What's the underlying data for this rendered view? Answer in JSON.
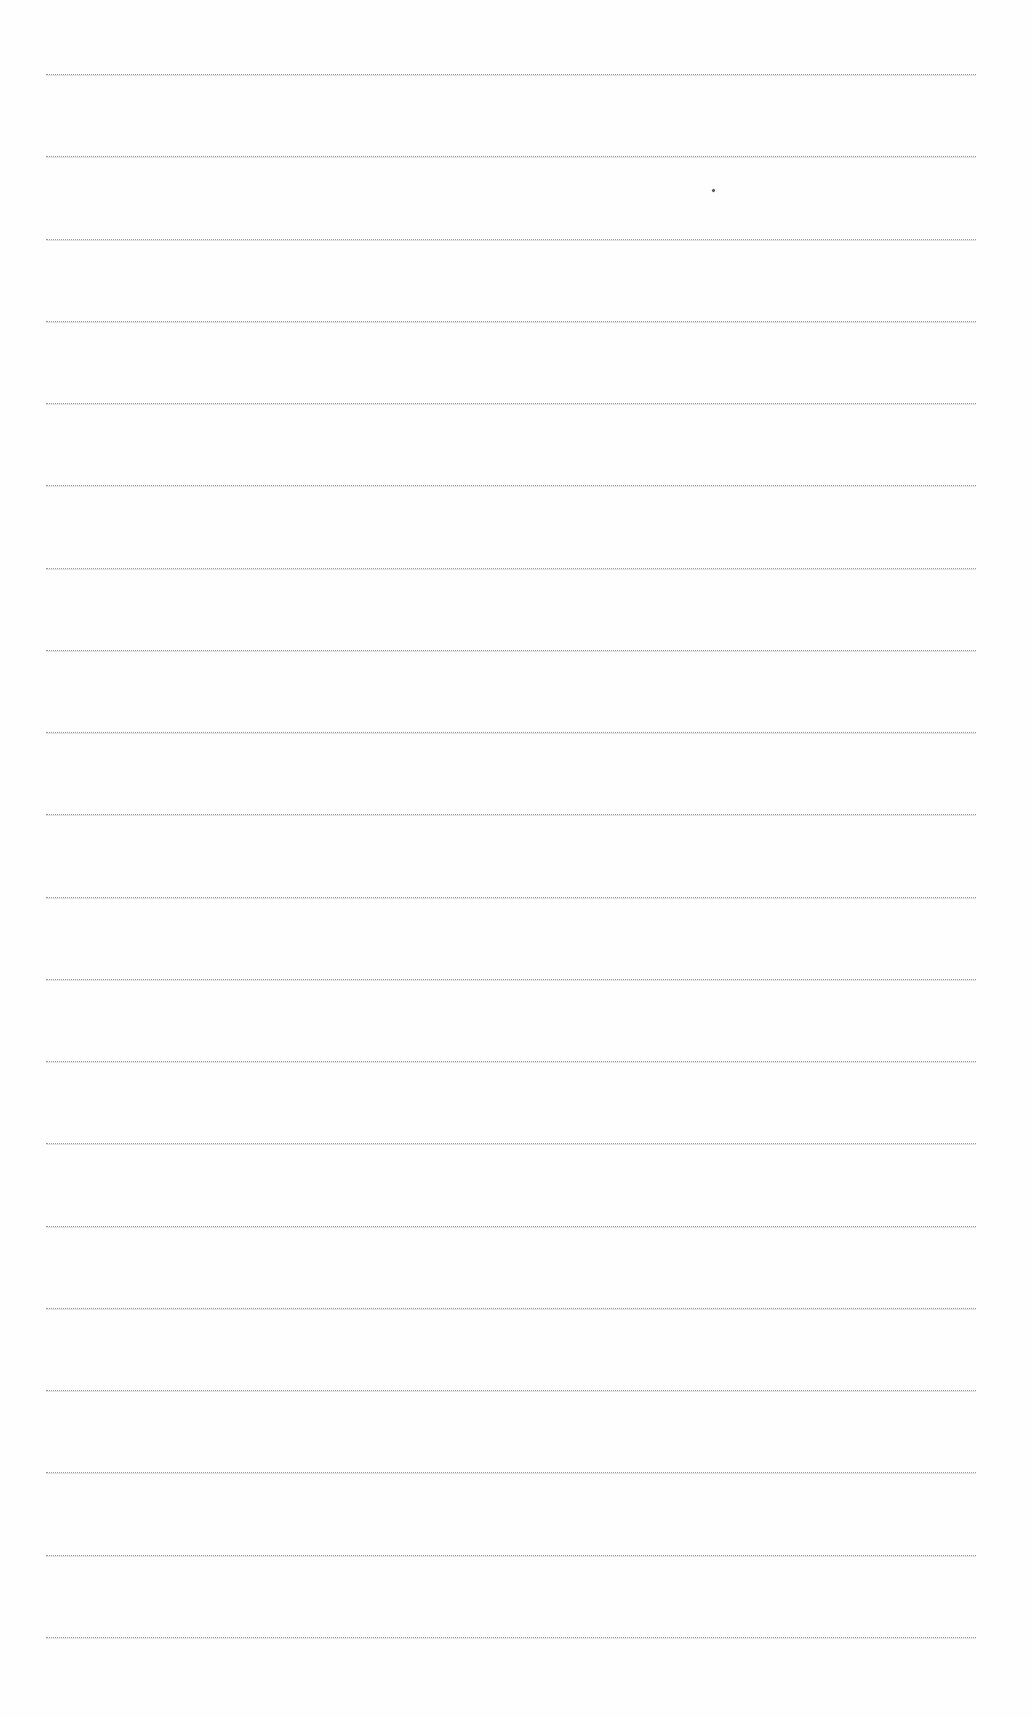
{
  "page": {
    "type": "lined-paper",
    "line_count": 20,
    "line_color": "#9a9a9a",
    "background": "#fefefe",
    "first_line_y": 74,
    "line_spacing": 82.26,
    "line_left": 46,
    "line_right": 976
  },
  "marks": [
    {
      "name": "ink-speck",
      "x": 712,
      "y": 189
    }
  ]
}
